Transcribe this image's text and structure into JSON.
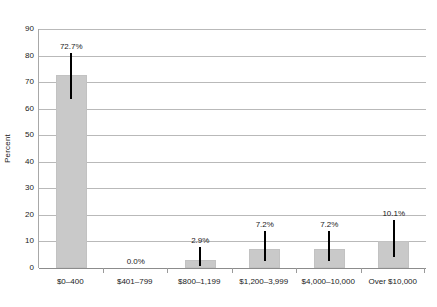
{
  "chart_data": {
    "type": "bar",
    "title": "",
    "subtitle": "",
    "xlabel": "",
    "ylabel": "Percent",
    "categories": [
      "$0–400",
      "$401–799",
      "$800–1,199",
      "$1,200–3,999",
      "$4,000–10,000",
      "Over $10,000"
    ],
    "values": [
      72.7,
      0.0,
      2.9,
      7.2,
      7.2,
      10.1
    ],
    "data_labels": [
      "72.7%",
      "0.0%",
      "2.9%",
      "7.2%",
      "7.2%",
      "10.1%"
    ],
    "error_bars": [
      {
        "low": 63.5,
        "high": 81.0
      },
      {
        "low": null,
        "high": null
      },
      {
        "low": 0.6,
        "high": 8.0
      },
      {
        "low": 2.6,
        "high": 14.0
      },
      {
        "low": 2.6,
        "high": 14.0
      },
      {
        "low": 4.0,
        "high": 18.0
      }
    ],
    "ylim": [
      0,
      90
    ],
    "yticks": [
      0,
      10,
      20,
      30,
      40,
      50,
      60,
      70,
      80,
      90
    ],
    "ytick_labels": [
      "0",
      "10",
      "20",
      "30",
      "40",
      "50",
      "60",
      "70",
      "80",
      "90"
    ],
    "grid": true,
    "legend": false,
    "legend_position": "none",
    "bar_color": "#c9c9c9",
    "errorbar_color": "#000000",
    "gridline_color": "#b9b9b9",
    "axis_color": "#8c8c8c",
    "background_color": "#ffffff"
  }
}
